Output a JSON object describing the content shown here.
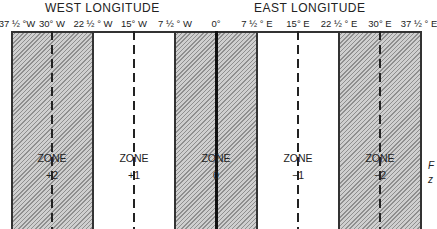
{
  "headers": {
    "west": "WEST LONGITUDE",
    "east": "EAST LONGITUDE"
  },
  "ticks": [
    {
      "label": "37 ½ °W",
      "x": 14
    },
    {
      "label": "30° W",
      "x": 52
    },
    {
      "label": "22 ½ ° W",
      "x": 93
    },
    {
      "label": "15° W",
      "x": 134
    },
    {
      "label": "7 ½ ° W",
      "x": 175
    },
    {
      "label": "0°",
      "x": 216
    },
    {
      "label": "7 ½ ° E",
      "x": 257
    },
    {
      "label": "15° E",
      "x": 298
    },
    {
      "label": "22 ½ ° E",
      "x": 339
    },
    {
      "label": "30° E",
      "x": 380
    },
    {
      "label": "37 ½ ° E",
      "x": 421
    }
  ],
  "zones": [
    {
      "name": "ZONE",
      "offset": "+2",
      "shaded": true
    },
    {
      "name": "ZONE",
      "offset": "+1",
      "shaded": false
    },
    {
      "name": "ZONE",
      "offset": "0",
      "shaded": true
    },
    {
      "name": "ZONE",
      "offset": "−1",
      "shaded": false
    },
    {
      "name": "ZONE",
      "offset": "−2",
      "shaded": true
    }
  ],
  "side_text": {
    "line1": "F",
    "line2": "z"
  }
}
